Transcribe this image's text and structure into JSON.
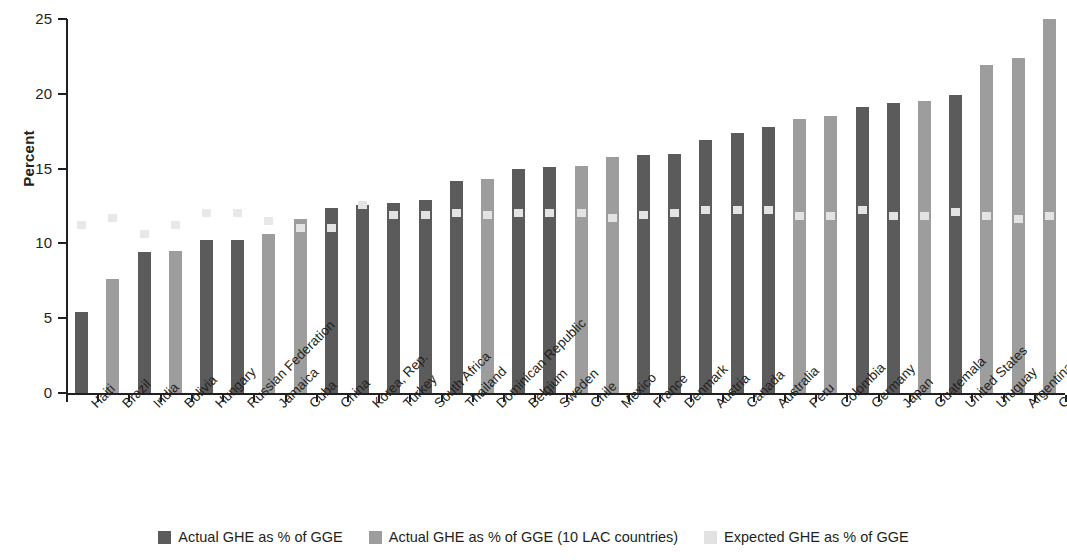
{
  "chart_data": {
    "type": "bar",
    "title": "",
    "subtitle": "",
    "xlabel": "",
    "ylabel": "Percent",
    "ylim": [
      0,
      25
    ],
    "yticks": [
      0,
      5,
      10,
      15,
      20,
      25
    ],
    "grid": false,
    "legend_position": "bottom",
    "categories": [
      "Haiti",
      "Brazil",
      "India",
      "Bolivia",
      "Hungary",
      "Russian Federation",
      "Jamaica",
      "Cuba",
      "China",
      "Korea, Rep.",
      "Turkey",
      "South Africa",
      "Thailand",
      "Dominican Republic",
      "Belgium",
      "Sweden",
      "Chile",
      "Mexico",
      "France",
      "Denmark",
      "Austria",
      "Canada",
      "Australia",
      "Peru",
      "Colombia",
      "Germany",
      "Japan",
      "Guatemala",
      "United States",
      "Uruguay",
      "Argentina",
      "Costa Rica"
    ],
    "series": [
      {
        "name": "Actual GHE as % of GGE",
        "color": "#5b5b5b",
        "values": [
          5.4,
          null,
          9.4,
          null,
          10.2,
          10.2,
          null,
          null,
          12.4,
          12.6,
          12.7,
          12.9,
          14.2,
          null,
          15.0,
          15.1,
          null,
          null,
          15.9,
          16.0,
          16.9,
          17.4,
          17.8,
          null,
          null,
          19.1,
          19.4,
          null,
          19.9,
          null,
          null,
          null
        ]
      },
      {
        "name": "Actual GHE as % of GGE (10 LAC countries)",
        "color": "#9d9d9d",
        "values": [
          null,
          7.6,
          null,
          9.5,
          null,
          null,
          10.6,
          11.6,
          null,
          null,
          null,
          null,
          null,
          14.3,
          null,
          null,
          15.2,
          15.8,
          null,
          null,
          null,
          null,
          null,
          18.3,
          18.5,
          null,
          null,
          19.5,
          null,
          21.9,
          22.4,
          25.0
        ]
      },
      {
        "name": "Expected GHE as % of GGE",
        "color": "#e2e2e2",
        "marker": "square",
        "values": [
          11.2,
          11.7,
          10.6,
          11.2,
          12.0,
          12.0,
          11.5,
          11.0,
          11.0,
          12.6,
          11.9,
          11.9,
          12.0,
          11.9,
          12.0,
          12.0,
          12.0,
          11.7,
          11.9,
          12.0,
          12.2,
          12.2,
          12.2,
          11.8,
          11.8,
          12.2,
          11.8,
          11.8,
          12.1,
          11.8,
          11.6,
          11.8
        ]
      }
    ]
  },
  "legend": {
    "items": [
      {
        "label": "Actual GHE as % of GGE",
        "swatch": "s-actual"
      },
      {
        "label": "Actual GHE as % of GGE (10 LAC countries)",
        "swatch": "s-lac"
      },
      {
        "label": "Expected GHE as % of GGE",
        "swatch": "s-expected"
      }
    ]
  }
}
